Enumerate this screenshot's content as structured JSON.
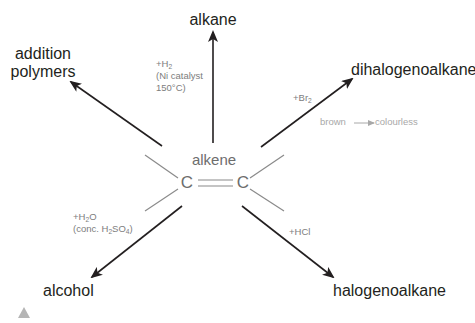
{
  "diagram": {
    "center": {
      "label": "alkene",
      "atom_left": "C",
      "atom_right": "C",
      "bond": "double"
    },
    "products": {
      "top": "alkane",
      "top_left_line1": "addition",
      "top_left_line2": "polymers",
      "top_right": "dihalogenoalkane",
      "bottom_left": "alcohol",
      "bottom_right": "halogenoalkane"
    },
    "conditions": {
      "hydrogenation": {
        "reagent_prefix": "+H",
        "reagent_sub": "2",
        "line2": "(Ni catalyst",
        "line3": "150°C)"
      },
      "bromination": {
        "reagent_prefix": "+Br",
        "reagent_sub": "2",
        "observation_from": "brown",
        "observation_to": "colourless"
      },
      "hydration": {
        "reagent_prefix": "+H",
        "reagent_sub": "2",
        "reagent_suffix": "O",
        "line2_prefix": "(conc. H",
        "line2_sub1": "2",
        "line2_mid": "SO",
        "line2_sub2": "4",
        "line2_suffix": ")"
      },
      "hydrohalogenation": {
        "reagent": "+HCl"
      }
    },
    "colors": {
      "arrow": "#231f20",
      "bond_lines": "#8a8a8a",
      "product_text": "#231f20",
      "condition_text": "#7d7d7d",
      "note_text": "#a8a8a8",
      "corner_marker": "#b5b5b5"
    },
    "icons": {
      "corner_marker": "triangle-icon"
    }
  }
}
